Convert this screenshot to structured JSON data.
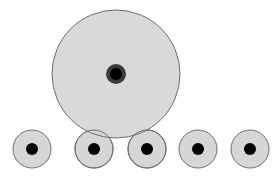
{
  "diagram": {
    "width": 279,
    "height": 181,
    "colors": {
      "background": "#ffffff",
      "fill": "#d6d6d6",
      "stroke": "#6e6e6e",
      "dot": "#000000",
      "dot_ring": "#3a3a3a"
    },
    "large_circle": {
      "cx": 116,
      "cy": 74,
      "r": 64,
      "ring_r": 10,
      "dot_r": 6
    },
    "small_circles": [
      {
        "cx": 32,
        "cy": 149,
        "r": 19,
        "dot_r": 6
      },
      {
        "cx": 94,
        "cy": 149,
        "r": 19,
        "dot_r": 6
      },
      {
        "cx": 147,
        "cy": 149,
        "r": 19,
        "dot_r": 6
      },
      {
        "cx": 198,
        "cy": 149,
        "r": 19,
        "dot_r": 6
      },
      {
        "cx": 250,
        "cy": 149,
        "r": 19,
        "dot_r": 6
      }
    ]
  }
}
